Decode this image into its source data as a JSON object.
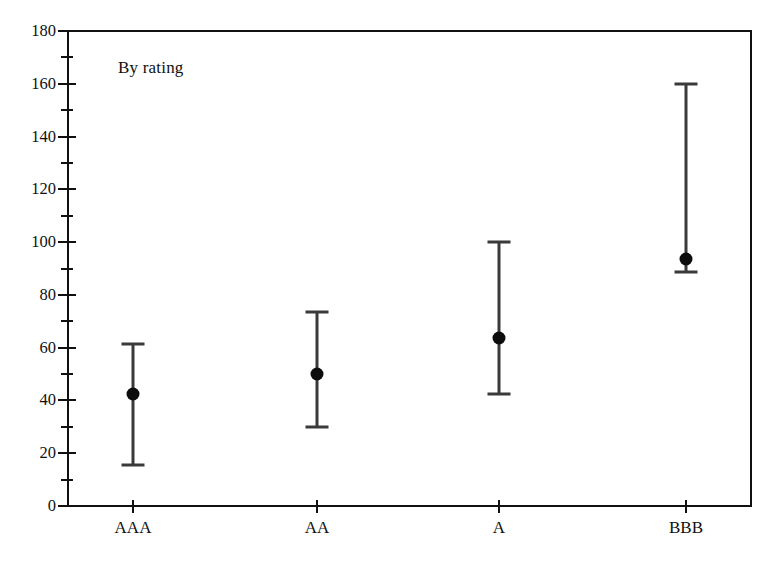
{
  "chart_data": {
    "type": "scatter",
    "title": "",
    "annotation": "By rating",
    "xlabel": "",
    "ylabel": "",
    "categories": [
      "AAA",
      "AA",
      "A",
      "BBB"
    ],
    "ylim": [
      0,
      180
    ],
    "y_major_ticks": [
      0,
      20,
      40,
      60,
      80,
      100,
      120,
      140,
      160,
      180
    ],
    "y_minor_ticks": [
      10,
      30,
      50,
      70,
      90,
      110,
      130,
      150,
      170
    ],
    "y_tick_labels": [
      "0",
      "20",
      "40",
      "60",
      "80",
      "100",
      "120",
      "140",
      "160",
      "180"
    ],
    "grid": false,
    "legend": false,
    "marker_styles": {
      "high": "cross-cap",
      "mean": "filled-circle",
      "low": "cross-cap",
      "range": "vertical-line"
    },
    "series": [
      {
        "name": "High",
        "values": [
          61.5,
          73.5,
          100.0,
          160.0
        ]
      },
      {
        "name": "Mean",
        "values": [
          42.5,
          50.0,
          63.5,
          93.5
        ]
      },
      {
        "name": "Low",
        "values": [
          15.5,
          30.0,
          42.5,
          88.5
        ]
      }
    ],
    "points": [
      {
        "category": "AAA",
        "high": 61.5,
        "mean": 42.5,
        "low": 15.5
      },
      {
        "category": "AA",
        "high": 73.5,
        "mean": 50.0,
        "low": 30.0
      },
      {
        "category": "A",
        "high": 100.0,
        "mean": 63.5,
        "low": 42.5
      },
      {
        "category": "BBB",
        "high": 160.0,
        "mean": 93.5,
        "low": 88.5
      }
    ],
    "colors": {
      "axis": "#111111",
      "range_line": "#3a3a3a",
      "mean_marker": "#0d0d0d",
      "background": "#ffffff"
    }
  }
}
